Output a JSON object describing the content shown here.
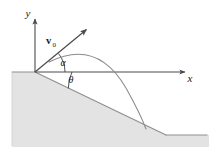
{
  "figure": {
    "name": "projectile-launched-from-edge-of-inclined-slope",
    "background_color": "#ffffff",
    "stroke_color": "#555555",
    "text_color": "#1a1a1a",
    "ground_fill_color": "#e3e3e3",
    "ground_edge_color": "#9a9a9a"
  },
  "axes": {
    "x_label": "x",
    "y_label": "y",
    "origin": {
      "x": 35,
      "y": 72
    },
    "x_axis_end": {
      "x": 192,
      "y": 72
    },
    "y_axis_top": {
      "x": 35,
      "y": 13
    }
  },
  "vectors": [
    {
      "name": "initial-velocity",
      "label_main": "v",
      "label_subscript": "0",
      "tail": {
        "x": 35,
        "y": 72
      },
      "tip": {
        "x": 89,
        "y": 27
      },
      "label_position": {
        "x": 47,
        "y": 42
      }
    }
  ],
  "angles": [
    {
      "name": "alpha",
      "label": "α",
      "description": "launch angle of v0 above the horizontal x-axis",
      "label_position": {
        "x": 63,
        "y": 66
      },
      "arc_radius": 30
    },
    {
      "name": "theta",
      "label": "θ",
      "description": "inclination angle of the downward slope below the horizontal",
      "label_position": {
        "x": 69,
        "y": 82
      },
      "arc_radius": 37
    }
  ],
  "trajectory": {
    "name": "parabolic-trajectory",
    "apex": {
      "x": 97,
      "y": 52
    },
    "landing_point": {
      "x": 146,
      "y": 129
    }
  },
  "terrain": {
    "name": "sloped-ground",
    "slope_start": {
      "x": 35,
      "y": 72
    },
    "slope_end": {
      "x": 166,
      "y": 135
    },
    "flat_right_end": {
      "x": 209,
      "y": 135
    },
    "left_edge": {
      "x": 12,
      "y": 72
    },
    "bottom": {
      "y": 147
    }
  }
}
